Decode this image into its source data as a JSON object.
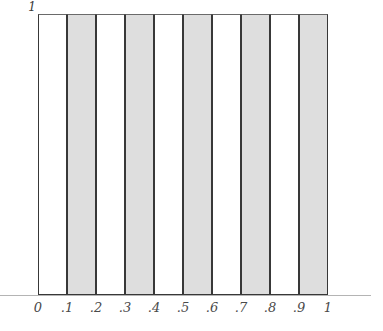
{
  "figure": {
    "background_color": "#ffffff",
    "width": 383,
    "height": 331
  },
  "axis": {
    "y_max_label": "1",
    "axis_line_color": "#b4b4b4"
  },
  "style": {
    "bar_fill_white": "#ffffff",
    "bar_fill_gray": "#dedede",
    "bar_edge_color": "#383838",
    "tick_label_color": "#4a4a4a"
  },
  "chart_data": {
    "type": "bar",
    "title": "",
    "subtitle": "",
    "xlabel": "",
    "ylabel": "",
    "grid": false,
    "legend": null,
    "xlim": [
      0,
      1
    ],
    "ylim": [
      0,
      1
    ],
    "x_tick_labels": [
      "0",
      ".1",
      ".2",
      ".3",
      ".4",
      ".5",
      ".6",
      ".7",
      ".8",
      ".9",
      "1"
    ],
    "x_tick_values": [
      0,
      0.1,
      0.2,
      0.3,
      0.4,
      0.5,
      0.6,
      0.7,
      0.8,
      0.9,
      1
    ],
    "y_tick_labels": [
      "1"
    ],
    "y_tick_values": [
      1
    ],
    "bin_edges": [
      0,
      0.1,
      0.2,
      0.3,
      0.4,
      0.5,
      0.6,
      0.7,
      0.8,
      0.9,
      1
    ],
    "categories": [
      "0-.1",
      ".1-.2",
      ".2-.3",
      ".3-.4",
      ".4-.5",
      ".5-.6",
      ".6-.7",
      ".7-.8",
      ".8-.9",
      ".9-1"
    ],
    "values": [
      1,
      1,
      1,
      1,
      1,
      1,
      1,
      1,
      1,
      1
    ],
    "bar_fills": [
      "white",
      "gray",
      "white",
      "gray",
      "white",
      "gray",
      "white",
      "gray",
      "white",
      "gray"
    ],
    "annotations": []
  }
}
